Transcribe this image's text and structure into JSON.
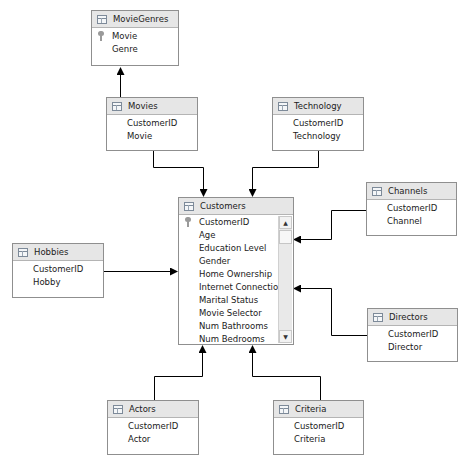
{
  "diagram": {
    "tables": {
      "moviegenres": {
        "title": "MovieGenres",
        "columns": [
          "Movie",
          "Genre"
        ],
        "key_column": "Movie"
      },
      "movies": {
        "title": "Movies",
        "columns": [
          "CustomerID",
          "Movie"
        ]
      },
      "technology": {
        "title": "Technology",
        "columns": [
          "CustomerID",
          "Technology"
        ]
      },
      "customers": {
        "title": "Customers",
        "key_column": "CustomerID",
        "columns": [
          "CustomerID",
          "Age",
          "Education Level",
          "Gender",
          "Home Ownership",
          "Internet Connection",
          "Marital Status",
          "Movie Selector",
          "Num Bathrooms",
          "Num Bedrooms",
          "Num C..."
        ]
      },
      "channels": {
        "title": "Channels",
        "columns": [
          "CustomerID",
          "Channel"
        ]
      },
      "hobbies": {
        "title": "Hobbies",
        "columns": [
          "CustomerID",
          "Hobby"
        ]
      },
      "directors": {
        "title": "Directors",
        "columns": [
          "CustomerID",
          "Director"
        ]
      },
      "actors": {
        "title": "Actors",
        "columns": [
          "CustomerID",
          "Actor"
        ]
      },
      "criteria": {
        "title": "Criteria",
        "columns": [
          "CustomerID",
          "Criteria"
        ]
      }
    },
    "relationships": [
      {
        "from": "Movies",
        "to": "MovieGenres"
      },
      {
        "from": "Movies",
        "to": "Customers"
      },
      {
        "from": "Technology",
        "to": "Customers"
      },
      {
        "from": "Channels",
        "to": "Customers"
      },
      {
        "from": "Hobbies",
        "to": "Customers"
      },
      {
        "from": "Directors",
        "to": "Customers"
      },
      {
        "from": "Actors",
        "to": "Customers"
      },
      {
        "from": "Criteria",
        "to": "Customers"
      }
    ],
    "scrollbar": {
      "up_arrow": "▲",
      "down_arrow": "▼"
    },
    "colors": {
      "header_bg": "#e6e6e6",
      "border": "#8f8f8f",
      "line": "#000000"
    }
  }
}
